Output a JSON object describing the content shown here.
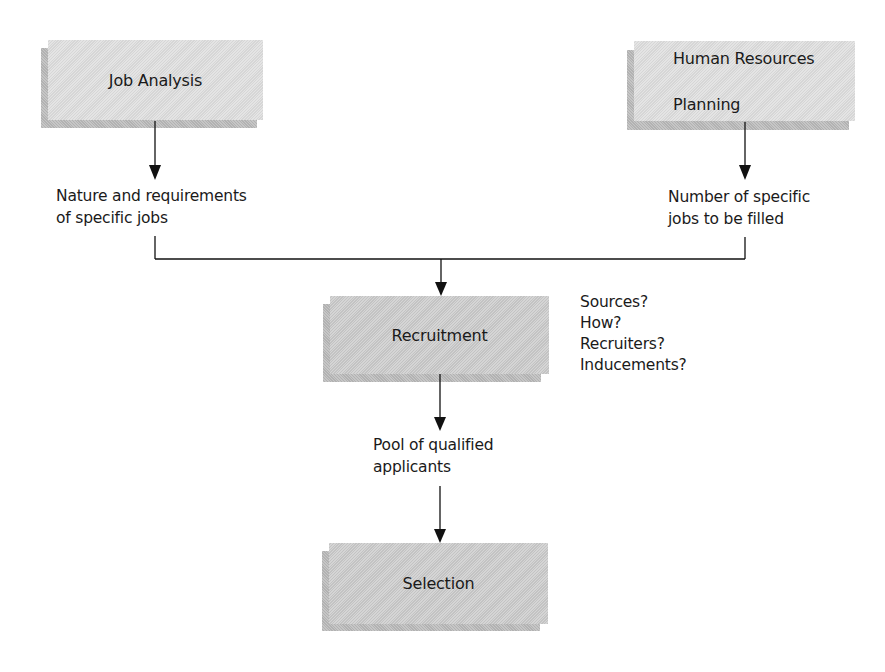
{
  "diagram": {
    "boxes": {
      "job_analysis": {
        "label": "Job Analysis"
      },
      "hr_planning": {
        "label_lines": [
          "Human Resources",
          "Planning"
        ]
      },
      "recruitment": {
        "label": "Recruitment"
      },
      "selection": {
        "label": "Selection"
      }
    },
    "outputs": {
      "job_analysis_output": {
        "lines": [
          "Nature and requirements",
          "of specific jobs"
        ]
      },
      "hr_planning_output": {
        "lines": [
          "Number of specific",
          "jobs to be filled"
        ]
      },
      "recruitment_output": {
        "lines": [
          "Pool of qualified",
          "applicants"
        ]
      }
    },
    "recruitment_questions": [
      "Sources?",
      "How?",
      "Recruiters?",
      "Inducements?"
    ],
    "colors": {
      "box_light": "#dddddd",
      "box_dark": "#c9c9c9",
      "shadow": "#b9b9b9",
      "line": "#111111"
    }
  }
}
